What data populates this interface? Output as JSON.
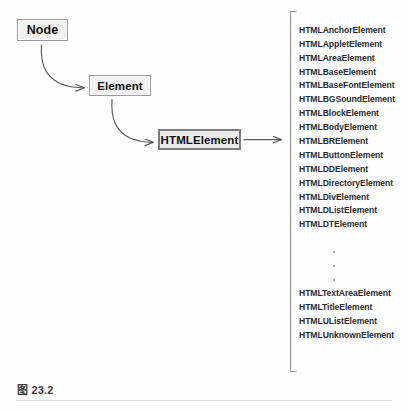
{
  "figure": {
    "caption": "图 23.2"
  },
  "hierarchy": {
    "nodes": [
      {
        "id": "node",
        "label": "Node"
      },
      {
        "id": "element",
        "label": "Element"
      },
      {
        "id": "htmlelement",
        "label": "HTMLElement"
      }
    ],
    "edges": [
      {
        "from": "Node",
        "to": "Element",
        "style": "curved-arrow"
      },
      {
        "from": "Element",
        "to": "HTMLElement",
        "style": "curved-arrow"
      },
      {
        "from": "HTMLElement",
        "to": "element-list",
        "style": "straight-arrow"
      }
    ]
  },
  "element_list": {
    "top_group": [
      "HTMLAnchorElement",
      "HTMLAppletElement",
      "HTMLAreaElement",
      "HTMLBaseElement",
      "HTMLBaseFontElement",
      "HTMLBGSoundElement",
      "HTMLBlockElement",
      "HTMLBodyElement",
      "HTMLBRElement",
      "HTMLButtonElement",
      "HTMLDDElement",
      "HTMLDirectoryElement",
      "HTMLDivElement",
      "HTMLDListElement",
      "HTMLDTElement"
    ],
    "continuation": "vertical-ellipsis",
    "bottom_group": [
      "HTMLTextAreaElement",
      "HTMLTitleElement",
      "HTMLUListElement",
      "HTMLUnknownElement"
    ]
  },
  "colors": {
    "box_fill": "#f0f0f0",
    "box_border": "#9a9a9a",
    "emphasis_border": "#7d7d7d",
    "arrow": "#5a5a5a",
    "bracket": "#9a9a9a",
    "text": "#2b2b2b",
    "rule": "#dcdcdc"
  }
}
